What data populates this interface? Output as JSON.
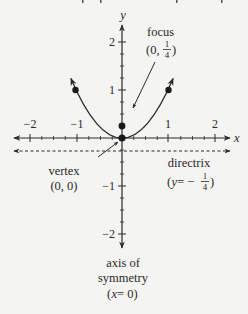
{
  "diagram": {
    "axes": {
      "x_label": "x",
      "y_label": "y",
      "x_ticks": [
        "−2",
        "−1",
        "1",
        "2"
      ],
      "y_ticks": [
        "2",
        "1",
        "−1",
        "−2"
      ]
    },
    "labels": {
      "focus": {
        "name": "focus",
        "coord_prefix": "(0, ",
        "frac_num": "1",
        "frac_den": "4",
        "coord_suffix": ")"
      },
      "vertex": {
        "name": "vertex",
        "coord": "(0, 0)"
      },
      "directrix": {
        "name": "directrix",
        "eq_prefix": "(",
        "eq_var": "y",
        "eq_mid": " = −",
        "frac_num": "1",
        "frac_den": "4",
        "eq_suffix": ")"
      },
      "axis_of_symmetry": {
        "line1": "axis of",
        "line2": "symmetry",
        "eq_prefix": "(",
        "eq_var": "x",
        "eq_rest": " = 0)"
      }
    },
    "points": [
      {
        "name": "vertex",
        "x": 0,
        "y": 0
      },
      {
        "name": "focus",
        "x": 0,
        "y": 0.25
      },
      {
        "name": "left-point",
        "x": -1,
        "y": 1
      },
      {
        "name": "right-point",
        "x": 1,
        "y": 1
      }
    ],
    "colors": {
      "ink": "#2a2a2a",
      "background": "#f4f4f2"
    }
  }
}
